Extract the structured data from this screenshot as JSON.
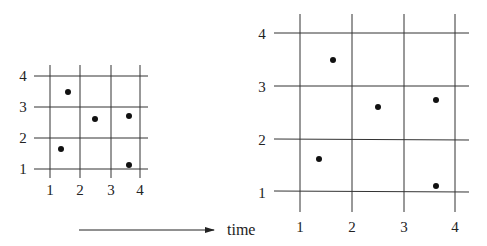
{
  "diagram": {
    "small_grid": {
      "x_ticks": [
        "1",
        "2",
        "3",
        "4"
      ],
      "y_ticks": [
        "1",
        "2",
        "3",
        "4"
      ],
      "points": [
        {
          "x": 1.6,
          "y": 3.5
        },
        {
          "x": 2.5,
          "y": 2.6
        },
        {
          "x": 3.6,
          "y": 2.7
        },
        {
          "x": 1.35,
          "y": 1.6
        },
        {
          "x": 3.6,
          "y": 1.1
        }
      ]
    },
    "large_grid": {
      "x_ticks": [
        "1",
        "2",
        "3",
        "4"
      ],
      "y_ticks": [
        "1",
        "2",
        "3",
        "4"
      ],
      "points": [
        {
          "x": 1.6,
          "y": 3.5
        },
        {
          "x": 2.5,
          "y": 2.6
        },
        {
          "x": 3.6,
          "y": 2.7
        },
        {
          "x": 1.35,
          "y": 1.6
        },
        {
          "x": 3.6,
          "y": 1.1
        }
      ]
    },
    "arrow": {
      "label": "time"
    }
  }
}
